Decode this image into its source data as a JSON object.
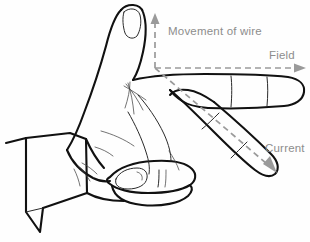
{
  "diagram": {
    "type": "physics-vector-hand-illustration",
    "background_color": "#fefefe",
    "ink_color": "#111111",
    "vector_color": "#9a9a9a",
    "label_color": "#8d8d8d"
  },
  "labels": {
    "movement": "Movement of wire",
    "field": "Field",
    "current": "Current"
  },
  "vectors": [
    {
      "name": "movement-of-wire",
      "label": "Movement of wire",
      "direction": "up",
      "style": "dashed",
      "origin": [
        155,
        68
      ],
      "tip": [
        155,
        15
      ],
      "color": "#9a9a9a",
      "maps_to": "thumb"
    },
    {
      "name": "field",
      "label": "Field",
      "direction": "right",
      "style": "dashed",
      "origin": [
        155,
        68
      ],
      "tip": [
        305,
        68
      ],
      "color": "#9a9a9a",
      "maps_to": "first-finger"
    },
    {
      "name": "current",
      "label": "Current",
      "direction": "down-right",
      "style": "dashed",
      "origin": [
        155,
        68
      ],
      "tip": [
        276,
        172
      ],
      "color": "#9a9a9a",
      "maps_to": "second-finger"
    }
  ],
  "hand": {
    "name": "left-hand-illustration",
    "orientation": "palm-facing-viewer-fingers-right",
    "parts": [
      "thumb-pointing-up",
      "index-finger-pointing-right",
      "middle-finger-pointing-down-right",
      "folded-fingers",
      "palm",
      "wrist-with-sleeve-cuff"
    ]
  }
}
